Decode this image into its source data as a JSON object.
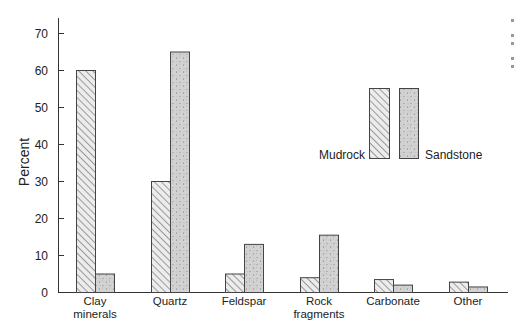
{
  "chart_data": {
    "type": "bar",
    "title": "",
    "xlabel": "",
    "ylabel": "Percent",
    "ylim": [
      0,
      70
    ],
    "yticks": [
      0,
      10,
      20,
      30,
      40,
      50,
      60,
      70
    ],
    "grid": false,
    "legend_position": "upper right (inside plot)",
    "categories": [
      [
        "Clay",
        "minerals"
      ],
      [
        "Quartz"
      ],
      [
        "Feldspar"
      ],
      [
        "Rock",
        "fragments"
      ],
      [
        "Carbonate"
      ],
      [
        "Other"
      ]
    ],
    "category_names": [
      "Clay minerals",
      "Quartz",
      "Feldspar",
      "Rock fragments",
      "Carbonate",
      "Other"
    ],
    "series": [
      {
        "name": "Mudrock",
        "pattern": "diagonal-hatch",
        "values": [
          60,
          30,
          5,
          4,
          3.5,
          2.8
        ]
      },
      {
        "name": "Sandstone",
        "pattern": "stipple",
        "values": [
          5,
          65,
          13,
          15.5,
          2,
          1.5
        ]
      }
    ]
  },
  "legend": {
    "mudrock_label": "Mudrock",
    "sandstone_label": "Sandstone"
  },
  "colors": {
    "axis": "#333333",
    "bar_edge": "#444444",
    "hatch_line": "#555555",
    "stipple_fill": "#d2d2d2",
    "stipple_dot": "#777777"
  }
}
